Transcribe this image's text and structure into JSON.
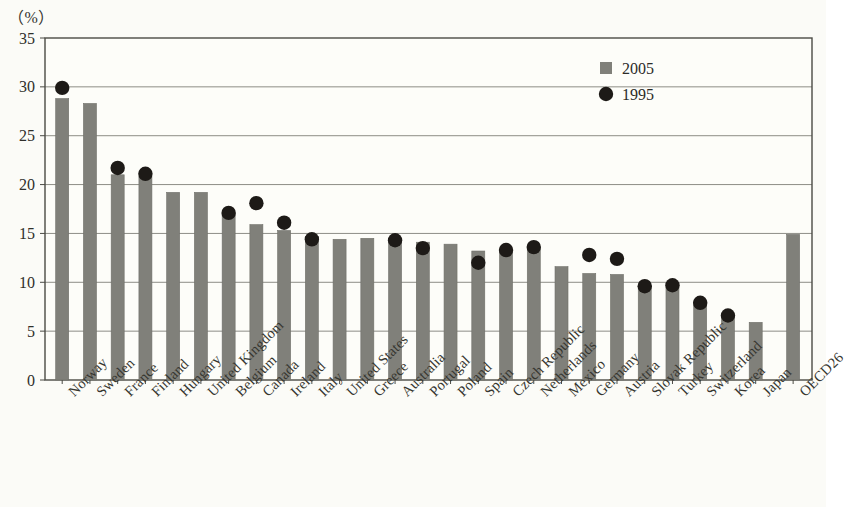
{
  "axis": {
    "unit_label": "（%）",
    "y_ticks": [
      "35",
      "30",
      "25",
      "20",
      "15",
      "10",
      "5",
      "0"
    ]
  },
  "legend": {
    "items": [
      {
        "label": "2005",
        "marker": "square-marker",
        "color": "#80807a"
      },
      {
        "label": "1995",
        "marker": "circle-marker",
        "color": "#1d1a17"
      }
    ]
  },
  "colors": {
    "bar": "#80807a",
    "bar_edge": "#6f6f69",
    "dot": "#1d1a17",
    "gridline": "#8d8d86",
    "frame": "#4b4b45",
    "plot_background": "#fdfdf9"
  },
  "chart_data": {
    "type": "bar",
    "title": "",
    "subtitle": "",
    "xlabel": "",
    "ylabel": "（%）",
    "ylim": [
      0,
      35
    ],
    "ytick_step": 5,
    "grid": true,
    "legend_position": "top-right",
    "categories": [
      "Norway",
      "Sweden",
      "France",
      "Finland",
      "Hungary",
      "United Kingdom",
      "Belgium",
      "Canada",
      "Ireland",
      "Italy",
      "United States",
      "Greece",
      "Australia",
      "Portugal",
      "Poland",
      "Spain",
      "Czech Republic",
      "Netherlands",
      "Mexico",
      "Germany",
      "Austria",
      "Slovak Republic",
      "Turkey",
      "Switzerland",
      "Korea",
      "Japan",
      "OECD26"
    ],
    "series": [
      {
        "name": "2005",
        "type": "bar",
        "values": [
          28.8,
          28.3,
          21.0,
          20.8,
          19.2,
          19.2,
          17.1,
          15.9,
          15.3,
          14.7,
          14.4,
          14.5,
          14.5,
          14.1,
          13.9,
          13.2,
          13.4,
          13.6,
          11.6,
          10.9,
          10.8,
          9.7,
          9.7,
          8.0,
          6.6,
          5.9,
          14.9
        ]
      },
      {
        "name": "1995",
        "type": "scatter",
        "values": [
          29.9,
          null,
          21.7,
          21.1,
          null,
          null,
          17.1,
          18.1,
          16.1,
          14.4,
          null,
          null,
          14.3,
          13.5,
          null,
          12.0,
          13.3,
          13.6,
          null,
          12.8,
          12.4,
          9.6,
          9.7,
          7.9,
          6.6,
          null,
          null
        ]
      }
    ]
  }
}
